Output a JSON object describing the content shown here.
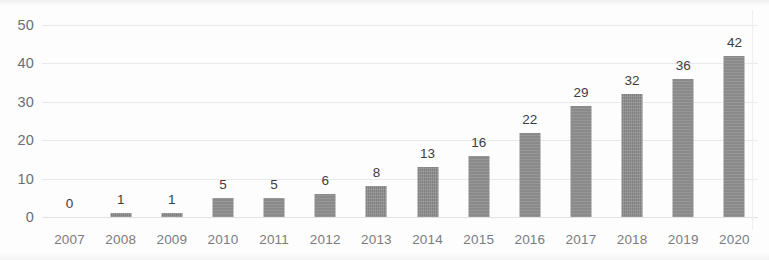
{
  "chart_data": {
    "type": "bar",
    "title": "",
    "subtitle": "",
    "xlabel": "",
    "ylabel": "",
    "categories": [
      "2007",
      "2008",
      "2009",
      "2010",
      "2011",
      "2012",
      "2013",
      "2014",
      "2015",
      "2016",
      "2017",
      "2018",
      "2019",
      "2020"
    ],
    "values": [
      0,
      1,
      1,
      5,
      5,
      6,
      8,
      13,
      16,
      22,
      29,
      32,
      36,
      42
    ],
    "data_labels": [
      "0",
      "1",
      "1",
      "5",
      "5",
      "6",
      "8",
      "13",
      "16",
      "22",
      "29",
      "32",
      "36",
      "42"
    ],
    "ylim": [
      0,
      50
    ],
    "y_ticks": [
      0,
      10,
      20,
      30,
      40,
      50
    ],
    "y_tick_labels": [
      "0",
      "10",
      "20",
      "30",
      "40",
      "50"
    ],
    "grid": true,
    "grid_axis": "y",
    "legend": false,
    "legend_position": "none",
    "series": [
      {
        "name": "",
        "values": [
          0,
          1,
          1,
          5,
          5,
          6,
          8,
          13,
          16,
          22,
          29,
          32,
          36,
          42
        ]
      }
    ]
  },
  "style": {
    "bar_color": "#8c8c8c",
    "gridline_color": "#e9e9ec",
    "data_label_color": "#3c3c40",
    "axis_label_color": "#6e6e72",
    "category_label_color": "#7b7b80",
    "background_color": "#fdfdfd"
  }
}
